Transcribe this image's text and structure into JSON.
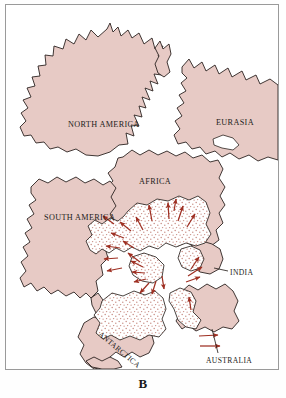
{
  "figure": {
    "caption": "B",
    "background_color": "#ffffff",
    "frame_color": "#9a9a9a"
  },
  "map": {
    "type": "paleogeographic-reconstruction",
    "title_shown": false,
    "continent_fill": "#e7cac5",
    "continent_stroke": "#2b2320",
    "ice_sheet_fill": "#ffffff",
    "ice_stipple_color": "#c98d84",
    "arrow_color": "#9e2f22",
    "labels": [
      {
        "id": "north-america",
        "text": "NORTH AMERICA",
        "x": 66,
        "y": 121,
        "rotate": 0
      },
      {
        "id": "eurasia",
        "text": "EURASIA",
        "x": 215,
        "y": 119,
        "rotate": 0
      },
      {
        "id": "africa",
        "text": "AFRICA",
        "x": 138,
        "y": 178,
        "rotate": 0
      },
      {
        "id": "south-america",
        "text": "SOUTH AMERICA",
        "x": 42,
        "y": 214,
        "rotate": 0
      },
      {
        "id": "india",
        "text": "INDIA",
        "x": 229,
        "y": 272,
        "rotate": 0
      },
      {
        "id": "antarctica",
        "text": "ANTARCTICA",
        "x": 99,
        "y": 338,
        "rotate": 38
      },
      {
        "id": "australia",
        "text": "AUSTRALIA",
        "x": 209,
        "y": 359,
        "rotate": 0
      }
    ],
    "leader_lines": [
      {
        "id": "india-leader",
        "from_x": 222,
        "from_y": 269,
        "to_x": 206,
        "to_y": 266
      },
      {
        "id": "australia-leader",
        "from_x": 213,
        "from_y": 350,
        "to_x": 206,
        "to_y": 325
      }
    ],
    "ice_flow_arrows": 26
  }
}
